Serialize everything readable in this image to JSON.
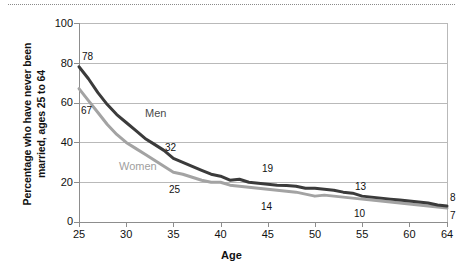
{
  "chart_data": {
    "type": "line",
    "title": "",
    "xlabel": "Age",
    "ylabel_line1": "Percentage who have never been",
    "ylabel_line2": "married, ages 25 to 64",
    "xlim": [
      25,
      64
    ],
    "ylim": [
      0,
      100
    ],
    "grid": "horizontal",
    "legend_position": "inline-labels",
    "y_ticks": [
      0,
      20,
      40,
      60,
      80,
      100
    ],
    "y_tick_labels": [
      "0",
      "20",
      "40",
      "60",
      "80",
      "100"
    ],
    "x_ticks": [
      25,
      30,
      35,
      40,
      45,
      50,
      55,
      60,
      64
    ],
    "x_tick_labels": [
      "25",
      "30",
      "35",
      "40",
      "45",
      "50",
      "55",
      "60",
      "64"
    ],
    "x": [
      25,
      26,
      27,
      28,
      29,
      30,
      31,
      32,
      33,
      34,
      35,
      36,
      37,
      38,
      39,
      40,
      41,
      42,
      43,
      44,
      45,
      46,
      47,
      48,
      49,
      50,
      51,
      52,
      53,
      54,
      55,
      56,
      57,
      58,
      59,
      60,
      61,
      62,
      63,
      64
    ],
    "series": [
      {
        "name": "Men",
        "color": "#3b3b3b",
        "values": [
          78,
          72,
          65,
          59,
          54,
          50,
          46,
          42,
          39,
          36,
          32,
          30,
          28,
          26,
          24,
          23,
          21,
          21.5,
          20,
          19.5,
          19,
          18.5,
          18.3,
          18,
          17,
          17,
          16.5,
          16,
          15,
          14.5,
          13,
          12.5,
          12,
          11.5,
          11,
          10.5,
          10,
          9.5,
          8.5,
          8
        ]
      },
      {
        "name": "Women",
        "color": "#a3a3a3",
        "values": [
          67,
          61,
          55,
          49,
          44,
          40,
          37,
          34,
          31,
          28,
          25,
          24,
          22.5,
          21,
          20,
          20,
          18.5,
          18,
          17.5,
          17,
          16.5,
          16,
          15.5,
          15,
          14,
          13,
          13.5,
          13,
          12.5,
          12,
          11.5,
          11,
          10.5,
          10,
          9.5,
          9,
          8.5,
          8,
          7.5,
          7
        ]
      }
    ],
    "point_labels": [
      {
        "text": "78",
        "series": "Men",
        "x": 25,
        "y": 78
      },
      {
        "text": "67",
        "series": "Women",
        "x": 25,
        "y": 67
      },
      {
        "text": "32",
        "series": "Men",
        "x": 35,
        "y": 32
      },
      {
        "text": "25",
        "series": "Women",
        "x": 35,
        "y": 25
      },
      {
        "text": "19",
        "series": "Men",
        "x": 45,
        "y": 19
      },
      {
        "text": "14",
        "series": "Women",
        "x": 45,
        "y": 14
      },
      {
        "text": "13",
        "series": "Men",
        "x": 55,
        "y": 13
      },
      {
        "text": "10",
        "series": "Women",
        "x": 55,
        "y": 10
      },
      {
        "text": "8",
        "series": "Men",
        "x": 64,
        "y": 8
      },
      {
        "text": "7",
        "series": "Women",
        "x": 64,
        "y": 7
      }
    ],
    "inline_series_labels": [
      {
        "text": "Men",
        "color": "#4a4a4a"
      },
      {
        "text": "Women",
        "color": "#a0a0a0"
      }
    ]
  },
  "axis": {
    "y_ticks": [
      "100",
      "80",
      "60",
      "40",
      "20",
      "0"
    ],
    "x_ticks": [
      "25",
      "30",
      "35",
      "40",
      "45",
      "50",
      "55",
      "60",
      "64"
    ],
    "x_title": "Age",
    "y_title_line1": "Percentage who have never been",
    "y_title_line2": "married, ages 25 to 64"
  },
  "labels": {
    "men": "Men",
    "women": "Women",
    "men_25": "78",
    "women_25": "67",
    "men_35": "32",
    "women_35": "25",
    "men_45": "19",
    "women_45": "14",
    "men_55": "13",
    "women_55": "10",
    "men_64": "8",
    "women_64": "7"
  }
}
